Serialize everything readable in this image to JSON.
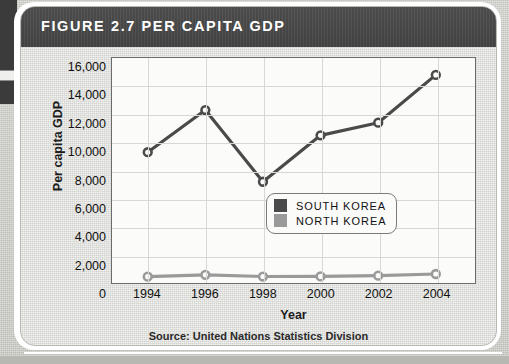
{
  "figure": {
    "title": "FIGURE 2.7 PER CAPITA GDP",
    "source": "Source: United Nations Statistics Division"
  },
  "colors": {
    "header_bg": "#4a4a4a",
    "header_text": "#ffffff",
    "panel_bg": "#dcdcd8",
    "plot_bg": "#fbfbfa",
    "grid": "#d7d7d3",
    "axis": "#6b6b6b",
    "south_korea": "#4a4a4a",
    "north_korea": "#9a9a9a"
  },
  "legend": {
    "position": "inside-right",
    "entries": [
      {
        "label": "SOUTH KOREA",
        "color": "#4a4a4a"
      },
      {
        "label": "NORTH KOREA",
        "color": "#9a9a9a"
      }
    ]
  },
  "chart_data": {
    "type": "line",
    "title": "FIGURE 2.7 PER CAPITA GDP",
    "subtitle": "",
    "xlabel": "Year",
    "ylabel": "Per capita GDP",
    "x": [
      1994,
      1996,
      1998,
      2000,
      2002,
      2004
    ],
    "categories": [
      "1994",
      "1996",
      "1998",
      "2000",
      "2002",
      "2004"
    ],
    "xtick_labels": [
      "1994",
      "1996",
      "1998",
      "2000",
      "2002",
      "2004"
    ],
    "ytick_labels": [
      "16,000",
      "14,000",
      "12,000",
      "10,000",
      "8,000",
      "6,000",
      "4,000",
      "2,000",
      "0"
    ],
    "yticks": [
      16000,
      14000,
      12000,
      10000,
      8000,
      6000,
      4000,
      2000,
      0
    ],
    "ylim": [
      0,
      16000
    ],
    "xlim": [
      1994,
      2004
    ],
    "grid": true,
    "legend_position": "inside-right",
    "annotations": [
      "Source: United Nations Statistics Division"
    ],
    "series": [
      {
        "name": "SOUTH KOREA",
        "color": "#4a4a4a",
        "marker": "circle",
        "values": [
          9300,
          12300,
          7200,
          10500,
          11400,
          14800
        ]
      },
      {
        "name": "NORTH KOREA",
        "color": "#9a9a9a",
        "marker": "circle",
        "values": [
          450,
          580,
          460,
          470,
          520,
          640
        ]
      }
    ]
  }
}
